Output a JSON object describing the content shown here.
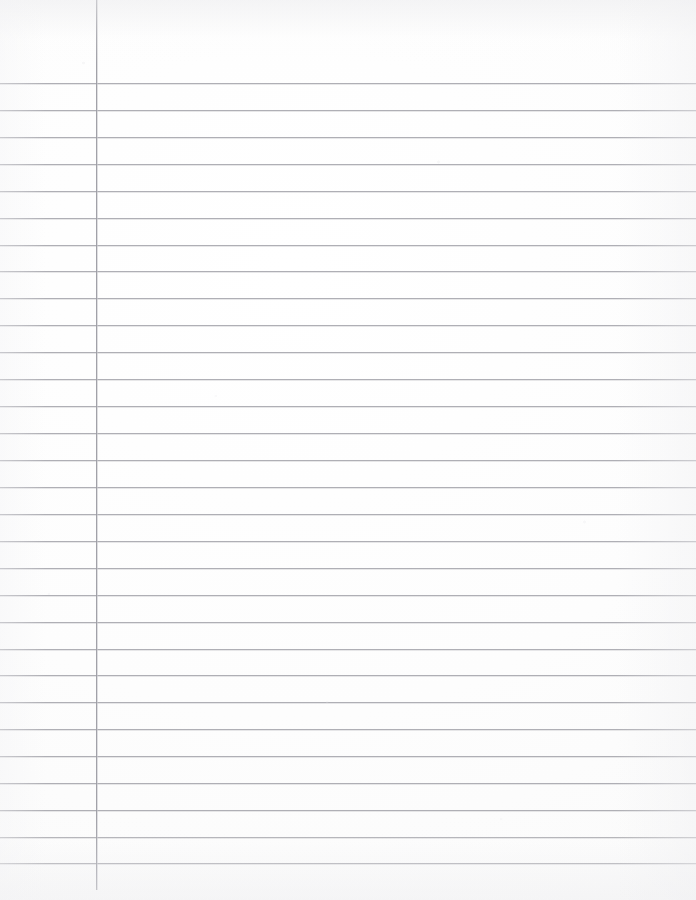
{
  "document": {
    "kind": "lined-notebook-paper",
    "title": "",
    "visible_text": "",
    "width_px": 696,
    "height_px": 900,
    "background_color": "#fdfdfd",
    "is_blank": true
  },
  "ruling": {
    "style": "wide-ruled",
    "horizontal_line_color": "#a9a9af",
    "horizontal_line_width_px": 1,
    "first_line_y": 83,
    "line_spacing_px": 26.9,
    "line_count": 30,
    "line_left_x": 0,
    "line_right_x": 696,
    "line_y_positions": [
      83,
      110,
      137,
      164,
      191,
      218,
      245,
      271,
      298,
      325,
      352,
      379,
      406,
      433,
      460,
      487,
      514,
      541,
      568,
      595,
      622,
      649,
      675,
      702,
      729,
      756,
      783,
      810,
      837,
      863
    ]
  },
  "margin_rule": {
    "orientation": "vertical",
    "color": "#9d9da4",
    "x": 96,
    "width_px": 1,
    "top_y": 0,
    "bottom_y": 890,
    "left_margin_width_px": 96
  },
  "regions": {
    "header_area_label": "header-area",
    "margin_column_label": "left-margin-column",
    "body_area_label": "writing-body-area"
  }
}
